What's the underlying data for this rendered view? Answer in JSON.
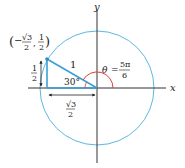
{
  "diagram": {
    "type": "unit-circle",
    "axes": {
      "x_label": "x",
      "y_label": "y"
    },
    "point": {
      "x_num": "√3",
      "x_den": "2",
      "x_sign": "−",
      "y_num": "1",
      "y_den": "2",
      "open_paren": "(",
      "comma": ",",
      "close_paren": ")"
    },
    "radius_label": "1",
    "reference_angle": "30°",
    "theta": {
      "symbol": "θ",
      "equals": "=",
      "num": "5π",
      "den": "6"
    },
    "vertical_leg": {
      "num": "1",
      "den": "2"
    },
    "horizontal_leg": {
      "num": "√3",
      "den": "2"
    },
    "colors": {
      "circle": "#5bb8e0",
      "triangle": "#3a9fd6",
      "angle_arc": "#e23b3b",
      "axes": "#333333",
      "point": "#2a8fc8"
    }
  }
}
